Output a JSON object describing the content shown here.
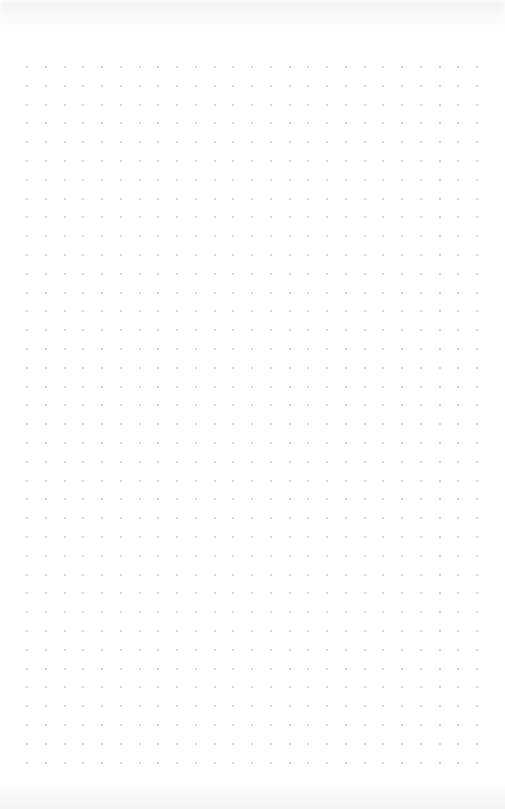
{
  "page": {
    "type": "dot-grid-paper",
    "background_color": "#ffffff",
    "dot_color": "#c9c9c9"
  },
  "grid": {
    "columns": 25,
    "rows": 38
  }
}
